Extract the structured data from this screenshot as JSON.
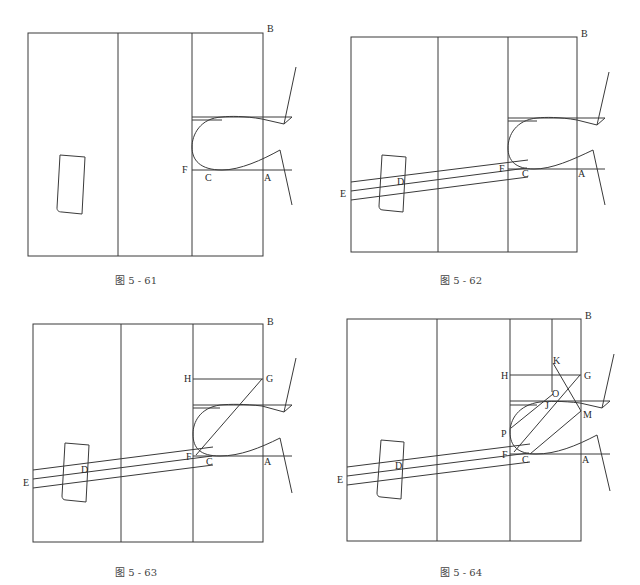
{
  "figures": [
    {
      "id": "fig-5-61",
      "caption": "图 5 - 61",
      "labels": {
        "B": "B",
        "F": "F",
        "C": "C",
        "A": "A"
      }
    },
    {
      "id": "fig-5-62",
      "caption": "图 5 - 62",
      "labels": {
        "B": "B",
        "F": "F",
        "C": "C",
        "A": "A",
        "D": "D",
        "E": "E"
      }
    },
    {
      "id": "fig-5-63",
      "caption": "图 5 - 63",
      "labels": {
        "B": "B",
        "F": "F",
        "C": "C",
        "A": "A",
        "D": "D",
        "E": "E",
        "G": "G",
        "H": "H"
      }
    },
    {
      "id": "fig-5-64",
      "caption": "图 5 - 64",
      "labels": {
        "B": "B",
        "F": "F",
        "C": "C",
        "A": "A",
        "D": "D",
        "E": "E",
        "G": "G",
        "H": "H",
        "K": "K",
        "O": "O",
        "J": "J",
        "M": "M",
        "P": "P"
      }
    }
  ],
  "colors": {
    "line": "#3a3a3a",
    "background": "#ffffff"
  }
}
